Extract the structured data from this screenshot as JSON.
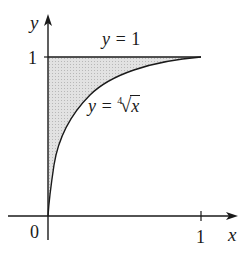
{
  "figure": {
    "axes": {
      "x_label": "x",
      "y_label": "y",
      "origin_label": "0",
      "x_tick_label": "1",
      "y_tick_label": "1"
    },
    "curves": [
      {
        "name": "horizontal-line",
        "equation_prefix": "y = ",
        "equation_value": "1"
      },
      {
        "name": "fourth-root-curve",
        "equation_prefix": "y = ",
        "root_index": "4",
        "radicand": "x"
      }
    ],
    "shaded_region": {
      "description": "region between y = 1 and y = fourth root of x, 0 ≤ x ≤ 1",
      "fill": "#d6d6d6"
    },
    "colors": {
      "stroke": "#1a1a1a",
      "shade": "#d6d6d6",
      "background": "#ffffff"
    }
  }
}
